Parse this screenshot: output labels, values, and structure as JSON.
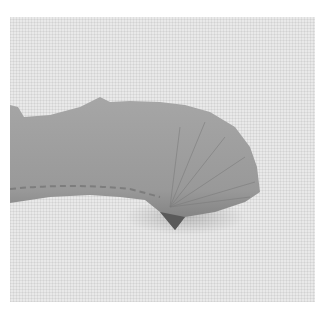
{
  "image": {
    "subject": "frayed grey fabric ribbon gathered into a fan at the right end, on white linen background",
    "colors": {
      "frame": "#ffffff",
      "background": "#e9e9e9",
      "ribbon": "#9a9a9a",
      "ribbon_shadow": "#6e6e6e"
    }
  }
}
